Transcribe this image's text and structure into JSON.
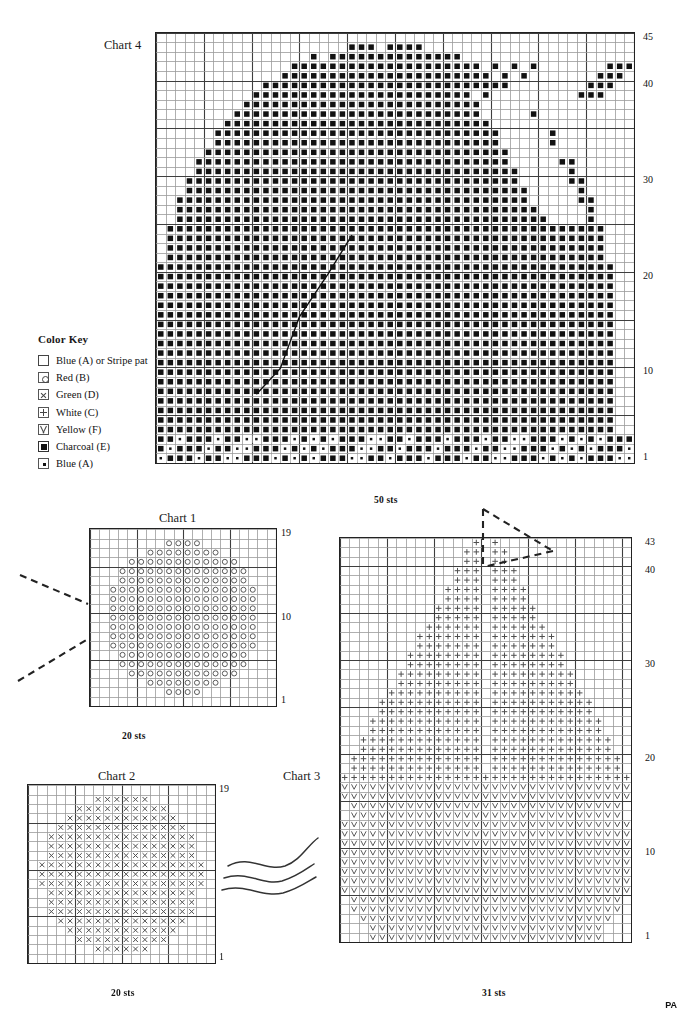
{
  "document": {
    "kind": "knitting-colorwork-chart-sheet",
    "corner_mark": "PA"
  },
  "color_key": {
    "title": "Color Key",
    "entries": [
      {
        "symbol": "empty-square",
        "label": "Blue (A) or Stripe pat"
      },
      {
        "symbol": "circle-square",
        "label": "Red (B)"
      },
      {
        "symbol": "x-square",
        "label": "Green (D)"
      },
      {
        "symbol": "plus-square",
        "label": "White (C)"
      },
      {
        "symbol": "vee-square",
        "label": "Yellow (F)"
      },
      {
        "symbol": "filled-square",
        "label": "Charcoal (E)"
      },
      {
        "symbol": "dot-square",
        "label": "Blue (A)"
      }
    ]
  },
  "charts": [
    {
      "id": "chart4",
      "title": "Chart 4",
      "sts_label": "50 sts",
      "stitches": 50,
      "rows": 45,
      "row_numbers": [
        "1",
        "10",
        "20",
        "30",
        "40",
        "45"
      ],
      "row_number_values": [
        1,
        10,
        20,
        30,
        40,
        45
      ],
      "symbol": "filled",
      "secondary_symbol": "dot",
      "grid": {
        "x": 155,
        "y": 32,
        "cell": 9.56
      },
      "title_pos": {
        "x": 104,
        "y": 38
      },
      "sts_pos": {
        "x": 374,
        "y": 495
      },
      "rownum_x": 643,
      "guideline": true
    },
    {
      "id": "chart1",
      "title": "Chart 1",
      "sts_label": "20 sts",
      "stitches": 20,
      "rows": 19,
      "row_numbers": [
        "1",
        "10",
        "19"
      ],
      "row_number_values": [
        1,
        10,
        19
      ],
      "symbol": "circle",
      "grid": {
        "x": 89,
        "y": 528,
        "cell": 9.3
      },
      "title_pos": {
        "x": 159,
        "y": 511
      },
      "sts_pos": {
        "x": 122,
        "y": 731
      },
      "rownum_x": 281
    },
    {
      "id": "chart2",
      "title": "Chart 2",
      "sts_label": "20 sts",
      "stitches": 20,
      "rows": 19,
      "row_numbers": [
        "1",
        "19"
      ],
      "row_number_values": [
        1,
        19
      ],
      "symbol": "ex",
      "grid": {
        "x": 27,
        "y": 784,
        "cell": 9.35
      },
      "title_pos": {
        "x": 98,
        "y": 769
      },
      "sts_pos": {
        "x": 111,
        "y": 988
      },
      "rownum_x": 219
    },
    {
      "id": "chart3",
      "title": "Chart 3",
      "sts_label": "31 sts",
      "stitches": 31,
      "rows": 43,
      "row_numbers": [
        "1",
        "10",
        "20",
        "30",
        "40",
        "43"
      ],
      "row_number_values": [
        1,
        10,
        20,
        30,
        40,
        43
      ],
      "symbol": "plus",
      "secondary_symbol": "vee",
      "grid": {
        "x": 339,
        "y": 537,
        "cell": 9.4
      },
      "title_pos": {
        "x": 283,
        "y": 769
      },
      "sts_pos": {
        "x": 482,
        "y": 988
      },
      "rownum_x": 645,
      "pointer": true
    }
  ],
  "annotations": {
    "chart1_leader_lines": 2,
    "chart2_wavy_lines": 3,
    "chart3_pointer": "dashed-triangle"
  },
  "colors": {
    "ink": "#1a1a1a",
    "grid_line": "#8a8a8a",
    "grid_major": "#3a3a3a",
    "border": "#222222",
    "charcoal": "#111111",
    "symbol": "#555555",
    "dash": "#222222"
  },
  "chart_data": {
    "type": "heatmap",
    "xlabel": "stitches",
    "ylabel": "rows",
    "grid": true,
    "legend": [
      "Blue (A) or Stripe pat",
      "Red (B)",
      "Green (D)",
      "White (C)",
      "Yellow (F)",
      "Charcoal (E)",
      "Blue (A)"
    ],
    "charts": [
      {
        "name": "Chart 4",
        "cols": 50,
        "rows": 45,
        "xlim": [
          1,
          50
        ],
        "ylim": [
          1,
          45
        ],
        "tick_labels_y": [
          1,
          10,
          20,
          30,
          40,
          45
        ],
        "symbol_primary": "Charcoal (E)",
        "symbol_secondary": "Blue (A)",
        "shape": "full leafy tree canopy filling most of grid, rounded top, sparse isolated clusters at upper right, bottom three rows alternating charcoal and blue dots"
      },
      {
        "name": "Chart 1",
        "cols": 20,
        "rows": 19,
        "xlim": [
          1,
          20
        ],
        "ylim": [
          1,
          19
        ],
        "tick_labels_y": [
          1,
          10,
          19
        ],
        "symbol_primary": "Red (B)",
        "shape": "large centered oval / round blossom"
      },
      {
        "name": "Chart 2",
        "cols": 20,
        "rows": 19,
        "xlim": [
          1,
          20
        ],
        "ylim": [
          1,
          19
        ],
        "tick_labels_y": [
          1,
          19
        ],
        "symbol_primary": "Green (D)",
        "shape": "large centered oval / round bush"
      },
      {
        "name": "Chart 3",
        "cols": 31,
        "rows": 43,
        "xlim": [
          1,
          31
        ],
        "ylim": [
          1,
          43
        ],
        "tick_labels_y": [
          1,
          10,
          20,
          30,
          40,
          43
        ],
        "symbol_primary": "White (C)",
        "symbol_secondary": "Yellow (F)",
        "shape": "rows 1-17 yellow rounded mound; rows 18-43 white heart/inverted-V peak with a center gap"
      }
    ]
  }
}
